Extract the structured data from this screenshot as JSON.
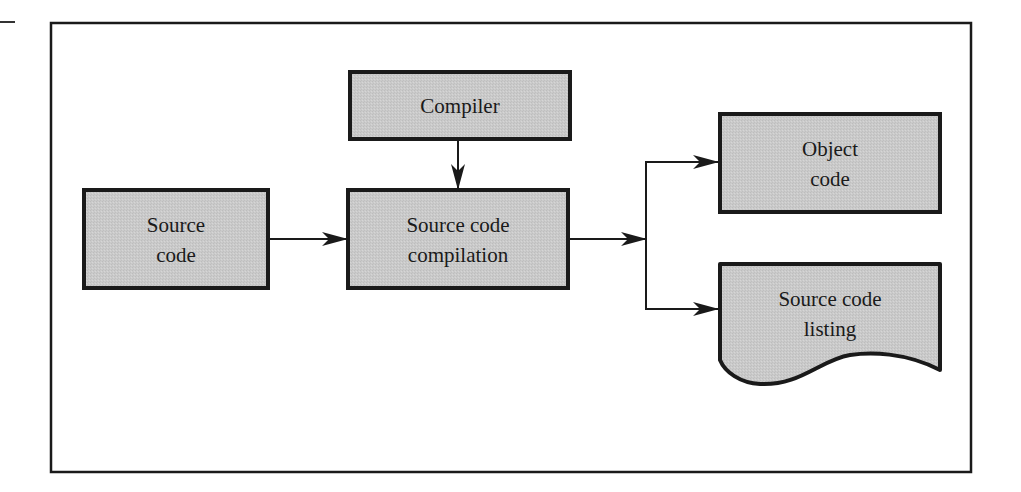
{
  "diagram": {
    "nodes": [
      {
        "id": "compiler",
        "label_lines": [
          "Compiler"
        ],
        "shape": "rectangle"
      },
      {
        "id": "source_code",
        "label_lines": [
          "Source",
          "code"
        ],
        "shape": "rectangle"
      },
      {
        "id": "compilation",
        "label_lines": [
          "Source code",
          "compilation"
        ],
        "shape": "rectangle"
      },
      {
        "id": "object_code",
        "label_lines": [
          "Object",
          "code"
        ],
        "shape": "rectangle"
      },
      {
        "id": "listing",
        "label_lines": [
          "Source code",
          "listing"
        ],
        "shape": "document"
      }
    ],
    "edges": [
      {
        "from": "compiler",
        "to": "compilation"
      },
      {
        "from": "source_code",
        "to": "compilation"
      },
      {
        "from": "compilation",
        "to": "object_code"
      },
      {
        "from": "compilation",
        "to": "listing"
      }
    ],
    "colors": {
      "box_fill": "#c8c8c8",
      "stroke": "#1a1a1a",
      "background": "#ffffff"
    }
  }
}
